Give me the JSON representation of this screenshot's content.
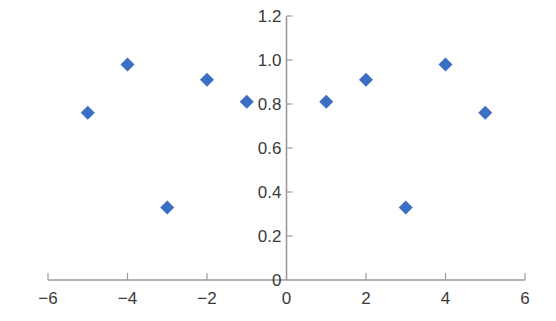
{
  "chart_data": {
    "type": "scatter",
    "title": "",
    "xlabel": "",
    "ylabel": "",
    "xlim": [
      -6,
      6
    ],
    "ylim": [
      0,
      1.2
    ],
    "grid": false,
    "legend": null,
    "x_ticks": [
      -6,
      -4,
      -2,
      0,
      2,
      4,
      6
    ],
    "x_tick_labels": [
      "−6",
      "−4",
      "−2",
      "0",
      "2",
      "4",
      "6"
    ],
    "y_ticks": [
      0,
      0.2,
      0.4,
      0.6,
      0.8,
      1.0,
      1.2
    ],
    "y_tick_labels": [
      "0",
      "0.2",
      "0.4",
      "0.6",
      "0.8",
      "1.0",
      "1.2"
    ],
    "series": [
      {
        "name": "series-1",
        "marker": "diamond",
        "color": "#3a6fc4",
        "points": [
          {
            "x": -5,
            "y": 0.76
          },
          {
            "x": -4,
            "y": 0.98
          },
          {
            "x": -3,
            "y": 0.33
          },
          {
            "x": -2,
            "y": 0.91
          },
          {
            "x": -1,
            "y": 0.81
          },
          {
            "x": 1,
            "y": 0.81
          },
          {
            "x": 2,
            "y": 0.91
          },
          {
            "x": 3,
            "y": 0.33
          },
          {
            "x": 4,
            "y": 0.98
          },
          {
            "x": 5,
            "y": 0.76
          }
        ]
      }
    ]
  }
}
